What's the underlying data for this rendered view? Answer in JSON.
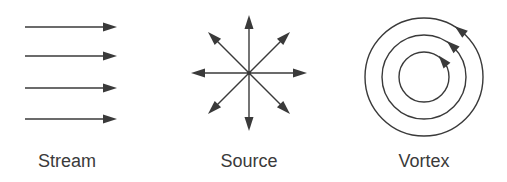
{
  "colors": {
    "line": "#3a3a3a",
    "background": "#ffffff"
  },
  "panels": [
    {
      "id": "stream",
      "label": "Stream",
      "icon": "parallel-arrows-icon",
      "description": "Four parallel horizontal arrows pointing right"
    },
    {
      "id": "source",
      "label": "Source",
      "icon": "radial-outward-arrows-icon",
      "description": "Eight arrows radiating outward from a central point"
    },
    {
      "id": "vortex",
      "label": "Vortex",
      "icon": "concentric-circles-icon",
      "description": "Three concentric circles with counter-clockwise arrowheads"
    }
  ]
}
